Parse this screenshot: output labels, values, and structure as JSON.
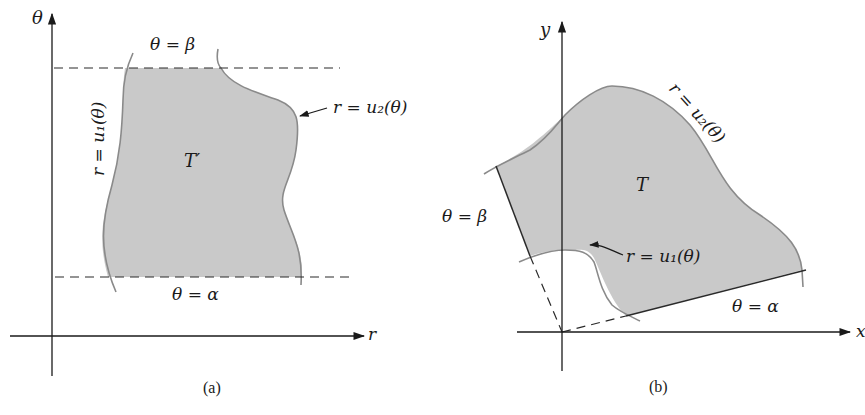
{
  "figure": {
    "panel_a": {
      "caption": "(a)",
      "axes": {
        "vertical": "θ",
        "horizontal": "r"
      },
      "region_label": "T′",
      "boundaries": {
        "top": "θ = β",
        "bottom": "θ = α",
        "left": "r = u₁(θ)",
        "right": "r = u₂(θ)"
      }
    },
    "panel_b": {
      "caption": "(b)",
      "axes": {
        "vertical": "y",
        "horizontal": "x"
      },
      "region_label": "T",
      "boundaries": {
        "upper_ray": "θ = β",
        "lower_ray": "θ = α",
        "inner": "r = u₁(θ)",
        "outer": "r = u₂(θ)"
      }
    },
    "colors": {
      "region_fill": "#c9c9c9",
      "curve_stroke": "#8a8a8a",
      "ink": "#1a1a1a"
    }
  }
}
